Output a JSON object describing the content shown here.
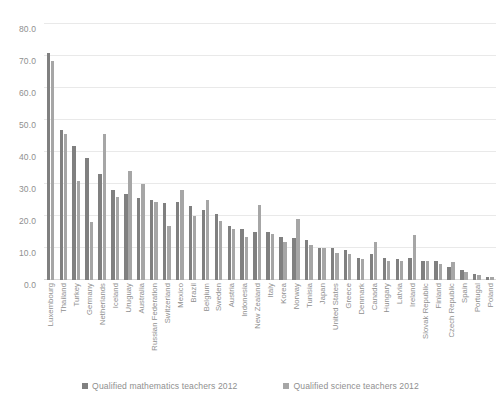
{
  "chart_data": {
    "type": "bar",
    "title": "",
    "subtitle": "",
    "xlabel": "",
    "ylabel": "",
    "ylim": [
      0,
      80
    ],
    "ytick_step": 10,
    "ytick_labels": [
      "0.0",
      "10.0",
      "20.0",
      "30.0",
      "40.0",
      "50.0",
      "60.0",
      "70.0",
      "80.0"
    ],
    "grid": true,
    "legend_position": "bottom",
    "orientation": "vertical",
    "categories": [
      "Luxembourg",
      "Thailand",
      "Turkey",
      "Germany",
      "Netherlands",
      "Iceland",
      "Uruguay",
      "Australia",
      "Russian Federation",
      "Switzerland",
      "Mexico",
      "Brazil",
      "Belgium",
      "Sweden",
      "Austria",
      "Indonesia",
      "New Zealand",
      "Italy",
      "Korea",
      "Norway",
      "Tunisia",
      "Japan",
      "United States",
      "Greece",
      "Denmark",
      "Canada",
      "Hungary",
      "Latvia",
      "Ireland",
      "Slovak Republic",
      "Finland",
      "Czech Republic",
      "Spain",
      "Portugal",
      "Poland"
    ],
    "series": [
      {
        "name": "Qualified mathematics teachers 2012",
        "color": "#808080",
        "values": [
          71.0,
          47.0,
          42.0,
          38.0,
          33.0,
          28.0,
          27.0,
          25.5,
          25.0,
          24.0,
          24.5,
          23.0,
          22.0,
          20.5,
          17.0,
          16.0,
          15.0,
          15.0,
          13.5,
          13.0,
          12.5,
          10.0,
          10.0,
          9.5,
          7.0,
          8.0,
          7.0,
          6.5,
          7.0,
          6.0,
          6.0,
          4.0,
          3.0,
          2.0,
          1.0
        ]
      },
      {
        "name": "Qualified science teachers 2012",
        "color": "#a6a6a6",
        "values": [
          68.5,
          45.5,
          31.0,
          18.0,
          45.5,
          26.0,
          34.0,
          30.0,
          24.5,
          17.0,
          28.0,
          20.0,
          25.0,
          18.5,
          16.0,
          13.5,
          23.5,
          14.5,
          12.0,
          19.0,
          11.0,
          10.0,
          8.5,
          8.0,
          6.5,
          12.0,
          6.0,
          6.0,
          14.0,
          6.0,
          5.0,
          5.5,
          2.5,
          1.5,
          0.8
        ]
      }
    ]
  },
  "legend": {
    "items": [
      {
        "label": "Qualified mathematics teachers 2012",
        "swatch_class": "math"
      },
      {
        "label": "Qualified science teachers 2012",
        "swatch_class": "sci"
      }
    ]
  }
}
